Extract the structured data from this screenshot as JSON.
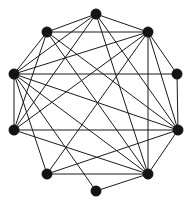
{
  "figure": {
    "width": 192,
    "height": 206,
    "background_color": "#ffffff",
    "edge_color": "#1a1a1a",
    "vertex_color": "#141414",
    "edge_width": 1,
    "vertex_radius": 5.2
  },
  "chart_data": {
    "type": "diagram",
    "layout": "circular",
    "title": "",
    "xlabel": "",
    "ylabel": "",
    "vertex_count": 10,
    "edge_count": 30,
    "nodes": [
      {
        "id": "n0",
        "label": "0",
        "x": 96,
        "y": 14,
        "degree": 6
      },
      {
        "id": "n1",
        "label": "1",
        "x": 148,
        "y": 32,
        "degree": 7
      },
      {
        "id": "n2",
        "label": "2",
        "x": 177,
        "y": 74,
        "degree": 3
      },
      {
        "id": "n3",
        "label": "3",
        "x": 178,
        "y": 130,
        "degree": 8
      },
      {
        "id": "n4",
        "label": "4",
        "x": 148,
        "y": 174,
        "degree": 9
      },
      {
        "id": "n5",
        "label": "5",
        "x": 96,
        "y": 191,
        "degree": 2
      },
      {
        "id": "n6",
        "label": "6",
        "x": 47,
        "y": 174,
        "degree": 4
      },
      {
        "id": "n7",
        "label": "7",
        "x": 14,
        "y": 130,
        "degree": 6
      },
      {
        "id": "n8",
        "label": "8",
        "x": 14,
        "y": 74,
        "degree": 11
      },
      {
        "id": "n9",
        "label": "9",
        "x": 47,
        "y": 32,
        "degree": 4
      }
    ],
    "edges": [
      {
        "source": "n0",
        "target": "n1"
      },
      {
        "source": "n0",
        "target": "n9"
      },
      {
        "source": "n0",
        "target": "n8"
      },
      {
        "source": "n0",
        "target": "n7"
      },
      {
        "source": "n0",
        "target": "n4"
      },
      {
        "source": "n0",
        "target": "n3"
      },
      {
        "source": "n1",
        "target": "n2"
      },
      {
        "source": "n1",
        "target": "n9"
      },
      {
        "source": "n1",
        "target": "n8"
      },
      {
        "source": "n1",
        "target": "n7"
      },
      {
        "source": "n1",
        "target": "n6"
      },
      {
        "source": "n1",
        "target": "n4"
      },
      {
        "source": "n1",
        "target": "n3"
      },
      {
        "source": "n2",
        "target": "n8"
      },
      {
        "source": "n2",
        "target": "n3"
      },
      {
        "source": "n3",
        "target": "n4"
      },
      {
        "source": "n3",
        "target": "n6"
      },
      {
        "source": "n3",
        "target": "n7"
      },
      {
        "source": "n3",
        "target": "n8"
      },
      {
        "source": "n3",
        "target": "n9"
      },
      {
        "source": "n4",
        "target": "n5"
      },
      {
        "source": "n4",
        "target": "n6"
      },
      {
        "source": "n4",
        "target": "n7"
      },
      {
        "source": "n4",
        "target": "n8"
      },
      {
        "source": "n4",
        "target": "n9"
      },
      {
        "source": "n5",
        "target": "n8"
      },
      {
        "source": "n6",
        "target": "n8"
      },
      {
        "source": "n7",
        "target": "n8"
      },
      {
        "source": "n7",
        "target": "n9"
      },
      {
        "source": "n8",
        "target": "n9"
      }
    ]
  }
}
